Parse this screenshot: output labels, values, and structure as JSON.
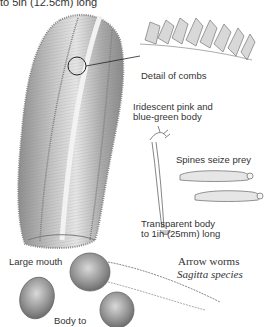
{
  "labels": {
    "top_caption": "to 5in (12.5cm) long",
    "detail_of_combs": "Detail of combs",
    "body_color_line1": "Iridescent pink and",
    "body_color_line2": "blue-green body",
    "spines": "Spines seize prey",
    "transparent_line1": "Transparent body",
    "transparent_line2": "to 1in (25mm) long",
    "large_mouth": "Large mouth",
    "body_to": "Body to",
    "arrow_worms_title": "Arrow worms",
    "arrow_worms_species": "Sagitta species"
  },
  "colors": {
    "background": "#ffffff",
    "pencil_dark": "#6b6b6b",
    "pencil_mid": "#9a9a9a",
    "pencil_light": "#c8c8c8",
    "text": "#333333"
  },
  "illustrations": [
    "comb-jelly-body",
    "comb-row-detail",
    "arrow-worm-head",
    "arrow-worm-bodies",
    "beroe-jelly-small"
  ]
}
